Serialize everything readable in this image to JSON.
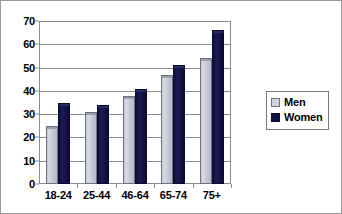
{
  "chart_data": {
    "type": "bar",
    "title": "",
    "subtitle": "",
    "xlabel": "",
    "ylabel": "",
    "categories": [
      "18-24",
      "25-44",
      "46-64",
      "65-74",
      "75+"
    ],
    "series": [
      {
        "name": "Men",
        "color": "#d0d3de",
        "values": [
          25,
          31,
          38,
          47,
          54
        ]
      },
      {
        "name": "Women",
        "color": "#10103e",
        "values": [
          35,
          34,
          41,
          51,
          66
        ]
      }
    ],
    "ylim": [
      0,
      70
    ],
    "ytick_step": 10,
    "yticks": [
      0,
      10,
      20,
      30,
      40,
      50,
      60,
      70
    ],
    "ytick_labels": [
      "0",
      "10",
      "20",
      "30",
      "40",
      "50",
      "60",
      "70"
    ],
    "grid": "horizontal",
    "legend_position": "right",
    "legend": [
      {
        "label": "Men",
        "swatch": "men"
      },
      {
        "label": "Women",
        "swatch": "women"
      }
    ]
  },
  "colors": {
    "men_bar": "#d0d3de",
    "women_bar": "#10103e",
    "gridline": "#8c8c8c",
    "frame": "#9a9a9a",
    "text": "#000000",
    "background": "#ffffff"
  }
}
